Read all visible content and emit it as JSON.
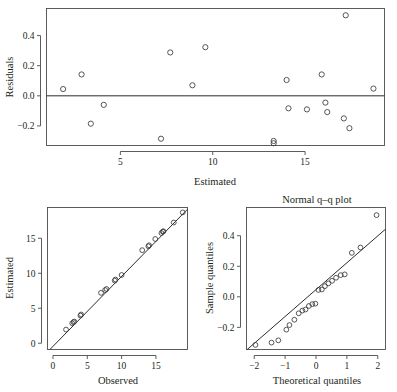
{
  "figure": {
    "background": "#ffffff",
    "marker_color": "#3a3a3a",
    "line_color": "#2b2b2b",
    "axis_color": "#4a4a4a"
  },
  "chart_data": [
    {
      "type": "scatter",
      "name": "residuals-vs-estimated",
      "title": "",
      "xlabel": "Estimated",
      "ylabel": "Residuals",
      "xlim": [
        1.0,
        19.3
      ],
      "ylim": [
        -0.33,
        0.58
      ],
      "xticks": [
        5,
        10,
        15
      ],
      "xticklabels": [
        "5",
        "10",
        "15"
      ],
      "yticks": [
        -0.2,
        0.0,
        0.2,
        0.4
      ],
      "yticklabels": [
        "-0.2",
        "0.0",
        "0.2",
        "0.4"
      ],
      "grid": false,
      "legend": "none",
      "hline": 0.0,
      "x": [
        1.9,
        2.9,
        3.4,
        4.1,
        7.2,
        7.7,
        8.9,
        9.6,
        13.3,
        13.3,
        14.0,
        14.1,
        15.1,
        15.9,
        16.1,
        16.2,
        17.1,
        17.2,
        17.4,
        18.7
      ],
      "y": [
        0.045,
        0.142,
        -0.185,
        -0.06,
        -0.285,
        0.288,
        0.07,
        0.323,
        -0.3,
        -0.315,
        0.105,
        -0.083,
        -0.09,
        0.142,
        -0.045,
        -0.108,
        -0.15,
        0.535,
        -0.215,
        0.048
      ]
    },
    {
      "type": "scatter",
      "name": "estimated-vs-observed",
      "title": "",
      "xlabel": "Observed",
      "ylabel": "Estimated",
      "xlim": [
        -0.8,
        19.6
      ],
      "ylim": [
        -0.9,
        19.4
      ],
      "xticks": [
        0,
        5,
        10,
        15
      ],
      "xticklabels": [
        "0",
        "5",
        "10",
        "15"
      ],
      "yticks": [
        0,
        5,
        10,
        15
      ],
      "yticklabels": [
        "0",
        "5",
        "10",
        "15"
      ],
      "grid": false,
      "legend": "none",
      "refline": {
        "slope": 1.0,
        "intercept": -0.45
      },
      "x": [
        1.9,
        2.8,
        3.0,
        3.1,
        4.0,
        4.1,
        7.0,
        7.6,
        7.8,
        9.0,
        9.1,
        10.0,
        13.0,
        13.9,
        14.0,
        14.9,
        15.8,
        16.0,
        16.1,
        17.6,
        18.9
      ],
      "y": [
        1.95,
        2.85,
        3.0,
        3.1,
        3.95,
        4.1,
        7.2,
        7.6,
        7.75,
        8.95,
        9.1,
        9.75,
        13.3,
        13.85,
        14.0,
        14.9,
        15.75,
        15.95,
        16.0,
        17.25,
        18.7
      ]
    },
    {
      "type": "scatter",
      "name": "normal-qq-plot",
      "title": "Normal q–q plot",
      "xlabel": "Theoretical quantiles",
      "ylabel": "Sample quantiles",
      "xlim": [
        -2.25,
        2.25
      ],
      "ylim": [
        -0.345,
        0.585
      ],
      "xticks": [
        -2,
        -1,
        0,
        1,
        2
      ],
      "xticklabels": [
        "-2",
        "-1",
        "0",
        "1",
        "2"
      ],
      "yticks": [
        -0.2,
        0.0,
        0.2,
        0.4
      ],
      "yticklabels": [
        "-0.2",
        "0.0",
        "0.2",
        "0.4"
      ],
      "grid": false,
      "legend": "none",
      "refline": {
        "slope": 0.176,
        "intercept": 0.047
      },
      "x": [
        -1.96,
        -1.44,
        -1.22,
        -0.96,
        -0.86,
        -0.7,
        -0.56,
        -0.44,
        -0.34,
        -0.23,
        -0.12,
        -0.02,
        0.08,
        0.19,
        0.29,
        0.4,
        0.52,
        0.65,
        0.8,
        0.93,
        1.16,
        1.44,
        1.96
      ],
      "y": [
        -0.315,
        -0.3,
        -0.285,
        -0.215,
        -0.185,
        -0.15,
        -0.108,
        -0.09,
        -0.083,
        -0.06,
        -0.048,
        -0.045,
        0.045,
        0.048,
        0.07,
        0.088,
        0.105,
        0.125,
        0.142,
        0.147,
        0.288,
        0.323,
        0.535
      ]
    }
  ]
}
